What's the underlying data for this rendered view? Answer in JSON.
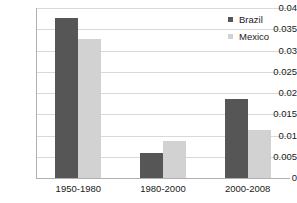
{
  "chart_data": {
    "type": "bar",
    "title": "",
    "subtitle": "",
    "xlabel": "",
    "ylabel": "",
    "categories": [
      "1950-1980",
      "1980-2000",
      "2000-2008"
    ],
    "series": [
      {
        "name": "Brazil",
        "color": "#565656",
        "values": [
          0.0377,
          0.0058,
          0.0185
        ]
      },
      {
        "name": "Mexico",
        "color": "#d2d2d2",
        "values": [
          0.0326,
          0.0087,
          0.0112
        ]
      }
    ],
    "ylim": [
      0,
      0.04
    ],
    "yticks": [
      "0",
      "0.005",
      "0.01",
      "0.015",
      "0.02",
      "0.025",
      "0.03",
      "0.035",
      "0.04"
    ],
    "ytick_values": [
      0,
      0.005,
      0.01,
      0.015,
      0.02,
      0.025,
      0.03,
      0.035,
      0.04
    ],
    "grid": true,
    "grid_axis": "y",
    "legend_position": "top-right",
    "legend": [
      "Brazil",
      "Mexico"
    ]
  }
}
